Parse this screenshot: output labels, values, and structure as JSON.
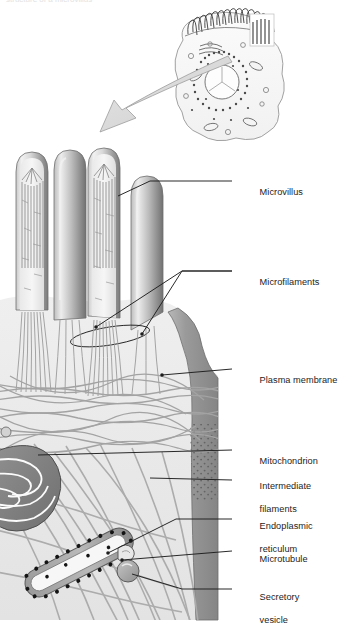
{
  "figure": {
    "clipped_header_text": "structure of a microvillus",
    "background_color": "#ffffff",
    "ink_color": "#1d1d1d",
    "leader_color": "#1d1d1d"
  },
  "inset": {
    "name": "epithelial-cell-overview",
    "description": "Whole epithelial cell with brush border of microvilli, nucleus, endoplasmic reticulum and organelles",
    "callout_box": "magnified region",
    "arrow": "magnification-arrow pointing lower-left"
  },
  "labels": [
    {
      "id": "microvillus",
      "text": "Microvillus",
      "x": 244,
      "y": 181,
      "line2": ""
    },
    {
      "id": "microfilaments",
      "text": "Microfilaments",
      "x": 244,
      "y": 271,
      "line2": ""
    },
    {
      "id": "plasma-membrane",
      "text": "Plasma membrane",
      "x": 244,
      "y": 369,
      "line2": ""
    },
    {
      "id": "mitochondrion",
      "text": "Mitochondrion",
      "x": 244,
      "y": 450,
      "line2": ""
    },
    {
      "id": "intermediate-filaments",
      "text": "Intermediate",
      "x": 244,
      "y": 475,
      "line2": "filaments"
    },
    {
      "id": "endoplasmic-reticulum",
      "text": "Endoplasmic",
      "x": 244,
      "y": 515,
      "line2": "reticulum"
    },
    {
      "id": "microtubule",
      "text": "Microtubule",
      "x": 244,
      "y": 548,
      "line2": ""
    },
    {
      "id": "secretory-vesicle",
      "text": "Secretory",
      "x": 244,
      "y": 586,
      "line2": "vesicle"
    }
  ],
  "structures": [
    {
      "id": "microvillus-1",
      "type": "microvillus",
      "cutaway": true,
      "note": "actin bundle visible"
    },
    {
      "id": "microvillus-2",
      "type": "microvillus",
      "cutaway": false,
      "note": "intact surface"
    },
    {
      "id": "microvillus-3",
      "type": "microvillus",
      "cutaway": true,
      "note": "actin bundle visible"
    },
    {
      "id": "microvillus-4",
      "type": "microvillus",
      "cutaway": false,
      "note": "intact surface"
    },
    {
      "id": "terminal-web",
      "type": "filament-network",
      "note": "horizontal actin/ intermediate filament mesh"
    },
    {
      "id": "mitochondrion-1",
      "type": "mitochondrion",
      "note": "folded cristae"
    },
    {
      "id": "rough-er",
      "type": "endoplasmic-reticulum",
      "note": "ribosome-studded tubule"
    },
    {
      "id": "microtubule-1",
      "type": "microtubule",
      "note": "slender tubule"
    },
    {
      "id": "secretory-vesicle-1",
      "type": "vesicle",
      "note": "round membrane-bound vesicle"
    },
    {
      "id": "plasma-membrane-band",
      "type": "plasma-membrane",
      "note": "stippled lateral membrane on right edge"
    }
  ],
  "leaders": [
    {
      "id": "leader-microvillus",
      "from": [
        232,
        181
      ],
      "to": [
        150,
        196
      ]
    },
    {
      "id": "leader-microfilaments",
      "from": [
        232,
        271
      ],
      "to": [
        96,
        327
      ]
    },
    {
      "id": "leader-plasma-membrane",
      "from": [
        232,
        369
      ],
      "to": [
        162,
        375
      ]
    },
    {
      "id": "leader-mitochondrion",
      "from": [
        232,
        450
      ],
      "to": [
        38,
        455
      ]
    },
    {
      "id": "leader-intermediate",
      "from": [
        232,
        480
      ],
      "to": [
        150,
        478
      ]
    },
    {
      "id": "leader-er",
      "from": [
        232,
        519
      ],
      "to": [
        108,
        553
      ]
    },
    {
      "id": "leader-microtubule",
      "from": [
        232,
        551
      ],
      "to": [
        122,
        560
      ]
    },
    {
      "id": "leader-vesicle",
      "from": [
        232,
        589
      ],
      "to": [
        130,
        572
      ]
    }
  ]
}
